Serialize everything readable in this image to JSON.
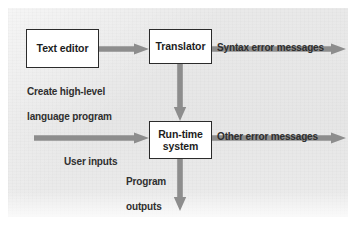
{
  "figure": {
    "background_color": "#e8e8e8",
    "arrow_color": "#8d8d8d",
    "box_border_color": "#2b2b2b",
    "box_fill_color": "#ffffff",
    "text_color": "#1d1d1d"
  },
  "nodes": [
    {
      "id": "text-editor",
      "label": "Text editor"
    },
    {
      "id": "translator",
      "label": "Translator"
    },
    {
      "id": "run-time-system",
      "label_line1": "Run-time",
      "label_line2": "system"
    }
  ],
  "captions": [
    {
      "id": "create-program",
      "line1": "Create high-level",
      "line2": "language program"
    },
    {
      "id": "user-inputs",
      "text": "User inputs"
    },
    {
      "id": "program-outputs",
      "line1": "Program",
      "line2": "outputs"
    },
    {
      "id": "syntax-errors",
      "text": "Syntax error messages"
    },
    {
      "id": "other-errors",
      "text": "Other error messages"
    }
  ],
  "arrows": [
    {
      "id": "editor-to-translator",
      "direction": "right"
    },
    {
      "id": "translator-to-runtime",
      "direction": "down"
    },
    {
      "id": "translator-syntax-errors",
      "direction": "right"
    },
    {
      "id": "user-inputs-to-runtime",
      "direction": "right"
    },
    {
      "id": "runtime-other-errors",
      "direction": "right"
    },
    {
      "id": "runtime-program-outputs",
      "direction": "down"
    }
  ]
}
